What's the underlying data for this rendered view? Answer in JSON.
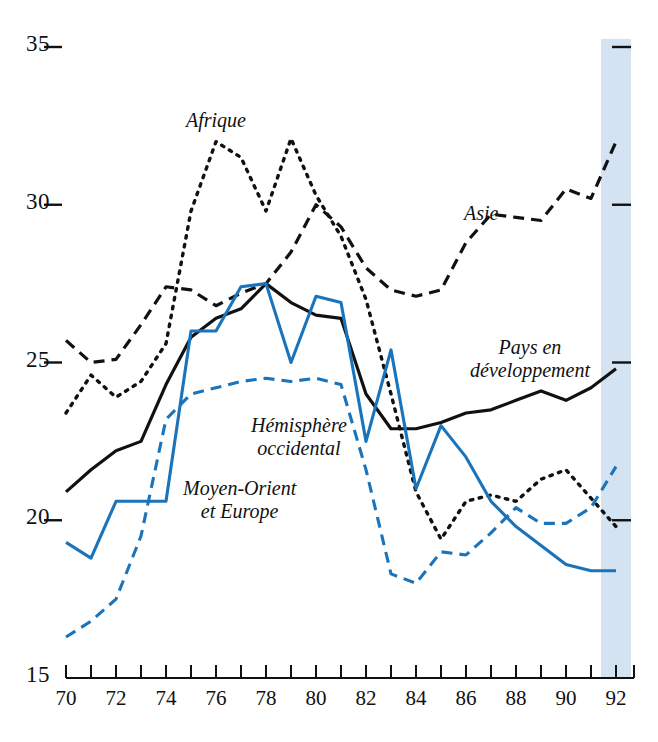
{
  "chart_data": {
    "type": "line",
    "title": "",
    "xlabel": "",
    "ylabel": "",
    "xlim": [
      70,
      92
    ],
    "ylim": [
      15,
      35
    ],
    "grid": false,
    "legend_position": "inline-annotations",
    "y_ticks": [
      "35",
      "30",
      "25",
      "20",
      "15"
    ],
    "y_tick_values": [
      35,
      30,
      25,
      20,
      15
    ],
    "x_ticks": [
      "70",
      "72",
      "74",
      "76",
      "78",
      "80",
      "82",
      "84",
      "86",
      "88",
      "90",
      "92"
    ],
    "x_tick_values": [
      70,
      72,
      74,
      76,
      78,
      80,
      82,
      84,
      86,
      88,
      90,
      92
    ],
    "x_minor_ticks": [
      71,
      73,
      75,
      77,
      79,
      81,
      83,
      85,
      87,
      89,
      91
    ],
    "x": [
      70,
      71,
      72,
      73,
      74,
      75,
      76,
      77,
      78,
      79,
      80,
      81,
      82,
      83,
      84,
      85,
      86,
      87,
      88,
      89,
      90,
      91,
      92
    ],
    "highlight_band": {
      "from": 91.4,
      "to": 92.6,
      "color": "#d3e3f1",
      "label": ""
    },
    "series": [
      {
        "name": "Afrique",
        "style": "dotted",
        "color": "#111111",
        "label": "Afrique",
        "values": [
          23.4,
          24.6,
          23.9,
          24.4,
          25.6,
          29.8,
          32.0,
          31.5,
          29.8,
          32.1,
          30.3,
          29.0,
          27.0,
          24.0,
          20.9,
          19.4,
          20.6,
          20.8,
          20.6,
          21.3,
          21.6,
          20.7,
          19.8
        ]
      },
      {
        "name": "Asie",
        "style": "dashed",
        "color": "#111111",
        "label": "Asie",
        "values": [
          25.7,
          25.0,
          25.1,
          26.2,
          27.4,
          27.3,
          26.8,
          27.2,
          27.5,
          28.5,
          30.0,
          29.3,
          28.0,
          27.3,
          27.1,
          27.3,
          28.8,
          29.7,
          29.6,
          29.5,
          30.5,
          30.2,
          32.0
        ]
      },
      {
        "name": "Pays en développement",
        "style": "solid",
        "color": "#111111",
        "label": "Pays en\ndéveloppement",
        "values": [
          20.9,
          21.6,
          22.2,
          22.5,
          24.3,
          25.8,
          26.4,
          26.7,
          27.5,
          26.9,
          26.5,
          26.4,
          24.0,
          22.9,
          22.9,
          23.1,
          23.4,
          23.5,
          23.8,
          24.1,
          23.8,
          24.2,
          24.8
        ]
      },
      {
        "name": "Moyen-Orient et Europe",
        "style": "solid",
        "color": "#1a74bb",
        "label": "Moyen-Orient\net Europe",
        "values": [
          19.3,
          18.8,
          20.6,
          20.6,
          20.6,
          26.0,
          26.0,
          27.4,
          27.5,
          25.0,
          27.1,
          26.9,
          22.5,
          25.4,
          21.0,
          23.0,
          22.0,
          20.6,
          19.8,
          19.2,
          18.6,
          18.4,
          18.4
        ]
      },
      {
        "name": "Hémisphère occidental",
        "style": "dashed",
        "color": "#1a74bb",
        "label": "Hémisphère\noccidental",
        "values": [
          16.3,
          16.8,
          17.5,
          19.5,
          23.2,
          24.0,
          24.2,
          24.4,
          24.5,
          24.4,
          24.5,
          24.3,
          21.6,
          18.3,
          18.0,
          19.0,
          18.9,
          19.6,
          20.4,
          19.9,
          19.9,
          20.4,
          21.7
        ]
      }
    ]
  },
  "annotations": {
    "afrique": "Afrique",
    "asie": "Asie",
    "pays_line1": "Pays en",
    "pays_line2": "développement",
    "hemisphere_line1": "Hémisphère",
    "hemisphere_line2": "occidental",
    "moyen_line1": "Moyen-Orient",
    "moyen_line2": "et Europe"
  }
}
